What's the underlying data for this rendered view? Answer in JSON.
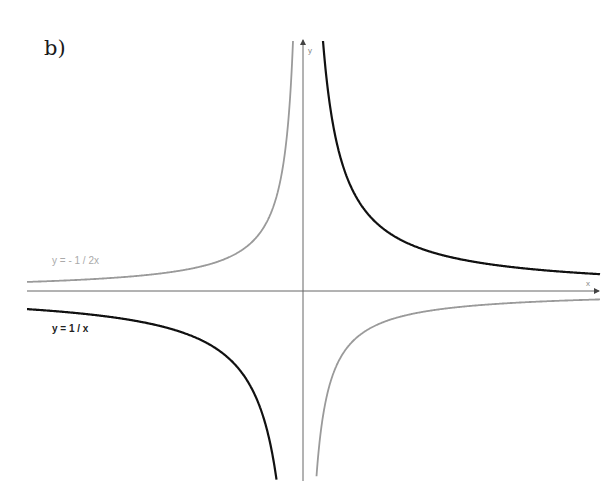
{
  "panel_label": "b)",
  "chart_data": {
    "type": "line",
    "title": "",
    "xlabel": "x",
    "ylabel": "y",
    "grid": false,
    "axes": {
      "origin_px": [
        303,
        291
      ],
      "x_axis_arrow": true,
      "y_axis_arrow": true
    },
    "series": [
      {
        "name": "y = 1 / x",
        "color": "#111111",
        "stroke_width": 2.2,
        "k_px": 5000,
        "annotation": {
          "text": "y = 1 / x",
          "x": 52,
          "y": 332,
          "bold": true,
          "color": "#222222"
        }
      },
      {
        "name": "y = - 1 / 2x",
        "color": "#9a9a9a",
        "stroke_width": 1.8,
        "k_px": -2500,
        "annotation": {
          "text": "y = - 1 / 2x",
          "x": 52,
          "y": 264,
          "bold": false,
          "color": "#aaaaaa"
        }
      }
    ],
    "ticks": []
  },
  "axis_labels": {
    "x": "x",
    "y": "y"
  }
}
